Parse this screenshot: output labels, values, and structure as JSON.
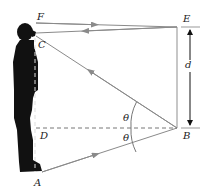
{
  "diagram": {
    "labels": {
      "F": "F",
      "C": "C",
      "E": "E",
      "d": "d",
      "D": "D",
      "B": "B",
      "A": "A",
      "theta_upper": "θ",
      "theta_lower": "θ"
    },
    "colors": {
      "ray": "#8a8a8a",
      "mirror": "#b5b5b5",
      "person": "#111111",
      "dashed": "#777777",
      "text": "#222222"
    }
  }
}
